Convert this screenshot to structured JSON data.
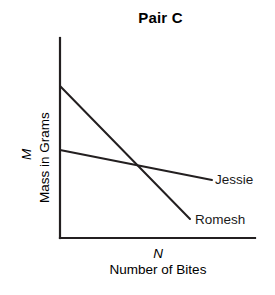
{
  "chart_data": {
    "type": "line",
    "title": "Pair C",
    "xlabel_symbol": "N",
    "xlabel": "Number of Bites",
    "ylabel_symbol": "M",
    "ylabel": "Mass in Grams",
    "grid": false,
    "legend_position": "inline-right-of-line-end",
    "axis_ticks": [],
    "axes": {
      "x_axis_from": [
        60,
        238
      ],
      "x_axis_to": [
        255,
        238
      ],
      "y_axis_from": [
        60,
        38
      ],
      "y_axis_to": [
        60,
        238
      ],
      "color": "#231f20"
    },
    "series": [
      {
        "name": "Romesh",
        "label": "Romesh",
        "color": "#231f20",
        "x": [
          0,
          1
        ],
        "y": [
          1.0,
          0.095
        ],
        "points_px": [
          [
            60,
            86
          ],
          [
            190,
            219
          ]
        ],
        "slope_description": "steep negative",
        "label_position_px": [
          195,
          212
        ]
      },
      {
        "name": "Jessie",
        "label": "Jessie",
        "color": "#231f20",
        "x": [
          0,
          1
        ],
        "y": [
          0.58,
          0.38
        ],
        "points_px": [
          [
            60,
            150
          ],
          [
            212,
            180
          ]
        ],
        "slope_description": "shallow negative",
        "label_position_px": [
          215,
          172
        ]
      }
    ],
    "intersection_px": [
      150,
      168
    ],
    "xlim": [
      0,
      1
    ],
    "ylim": [
      0,
      1
    ]
  },
  "figure": {
    "width": 275,
    "height": 295,
    "background": "#ffffff"
  }
}
